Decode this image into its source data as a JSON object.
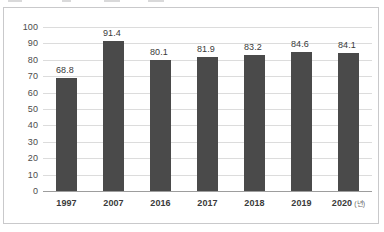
{
  "chart_data": {
    "type": "bar",
    "title": "",
    "xlabel": "",
    "ylabel": "",
    "categories": [
      "1997",
      "2007",
      "2016",
      "2017",
      "2018",
      "2019",
      "2020"
    ],
    "category_labels": [
      "1997",
      "2007",
      "2016",
      "2017",
      "2018",
      "2019",
      "2020"
    ],
    "x_unit_suffix": "(년)",
    "values": [
      68.8,
      91.4,
      80.1,
      81.9,
      83.2,
      84.6,
      84.1
    ],
    "value_labels": [
      "68.8",
      "91.4",
      "80.1",
      "81.9",
      "83.2",
      "84.6",
      "84.1"
    ],
    "ylim": [
      0,
      100
    ],
    "ytick_step": 10,
    "ytick_labels": [
      "100",
      "90",
      "80",
      "70",
      "60",
      "50",
      "40",
      "30",
      "20",
      "10",
      "0"
    ],
    "ytick_values": [
      100,
      90,
      80,
      70,
      60,
      50,
      40,
      30,
      20,
      10,
      0
    ],
    "grid": true,
    "grid_axis": "y",
    "legend": false,
    "legend_position": "none",
    "bar_color": "#4a4a4a",
    "grid_color": "#dcdcdc",
    "axis_color": "#9d9d9d",
    "frame_color": "#c9c9cb",
    "background_color": "#ffffff",
    "label_color": "#3a3a3a"
  }
}
